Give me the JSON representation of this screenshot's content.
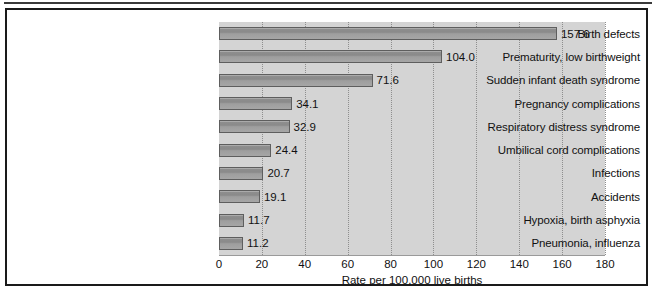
{
  "figure": {
    "background_color": "#ffffff",
    "frame_color": "#1a1a1a",
    "plot_background_color": "#d4d4d4",
    "bar_fill_color": "#8f8f8f",
    "bar_border_color": "#5e5e5e",
    "gridline_color": "#8e8e8e",
    "text_color": "#111111"
  },
  "chart_data": {
    "type": "bar",
    "orientation": "horizontal",
    "title": "",
    "subtitle": "",
    "xlabel": "Rate per 100,000 live births",
    "ylabel": "",
    "xlim": [
      0,
      180
    ],
    "xticks": [
      0,
      20,
      40,
      60,
      80,
      100,
      120,
      140,
      160,
      180
    ],
    "xtick_labels": [
      "0",
      "20",
      "40",
      "60",
      "80",
      "100",
      "120",
      "140",
      "160",
      "180"
    ],
    "grid": "vertical-dotted",
    "legend": "none",
    "categories": [
      "Birth defects",
      "Prematurity, low birthweight",
      "Sudden infant death syndrome",
      "Pregnancy complications",
      "Respiratory distress syndrome",
      "Umbilical cord complications",
      "Infections",
      "Accidents",
      "Hypoxia, birth asphyxia",
      "Pneumonia, influenza"
    ],
    "values": [
      157.6,
      104.0,
      71.6,
      34.1,
      32.9,
      24.4,
      20.7,
      19.1,
      11.7,
      11.2
    ],
    "value_labels": [
      "157.6",
      "104.0",
      "71.6",
      "34.1",
      "32.9",
      "24.4",
      "20.7",
      "19.1",
      "11.7",
      "11.2"
    ]
  }
}
